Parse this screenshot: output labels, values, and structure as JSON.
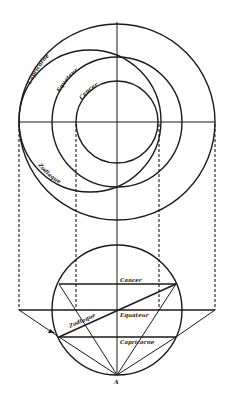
{
  "diagram": {
    "type": "astrolabe stereographic projection construction",
    "plan_view": {
      "labels": {
        "capricorn": "Capricorne",
        "equator": "Equateur",
        "cancer": "Cancer",
        "ecliptic": "Zodiaque"
      }
    },
    "elevation_view": {
      "labels": {
        "cancer": "Cancer",
        "equator": "Equateur",
        "capricorn": "Capricorne",
        "ecliptic": "Zodiaque",
        "pole_point": "A"
      }
    },
    "colors": {
      "ink": "#1a1a1a",
      "background": "#ffffff"
    }
  }
}
